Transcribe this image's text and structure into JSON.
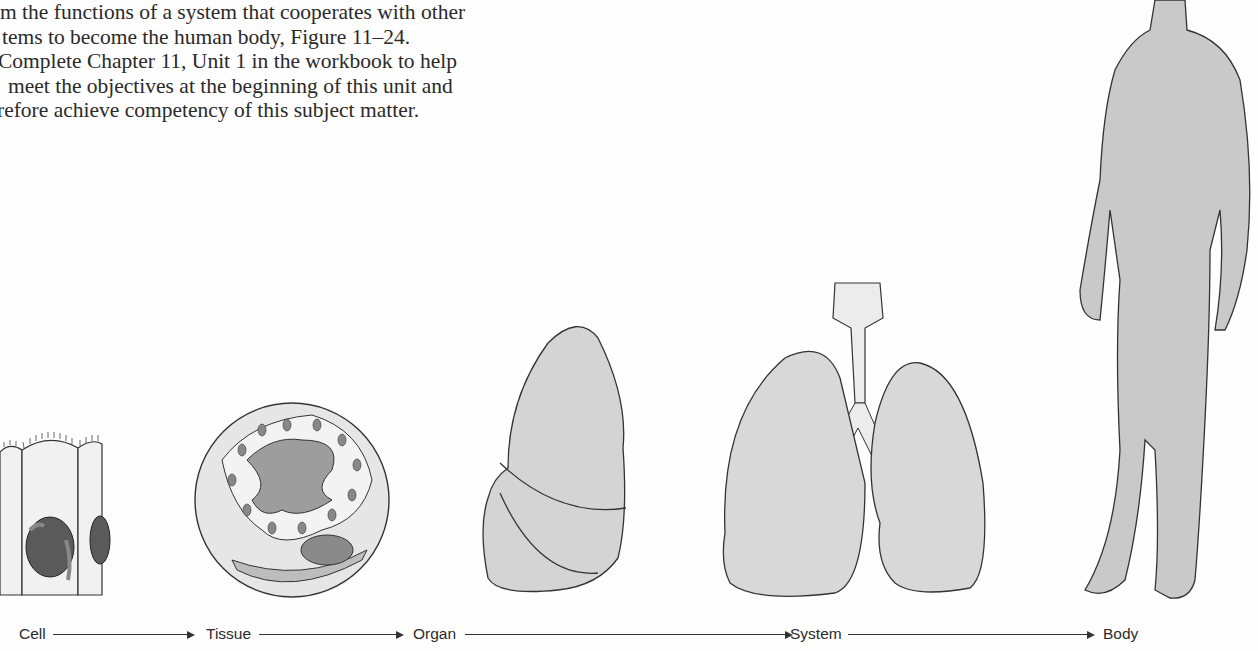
{
  "text": {
    "lines": [
      "m the functions of a system that cooperates with other",
      "tems to become the human body, Figure 11–24.",
      "Complete Chapter 11, Unit 1 in the workbook to help",
      "meet the objectives at the beginning of this unit and",
      "refore achieve competency of this subject matter."
    ]
  },
  "figure": {
    "reference": "Figure 11–24",
    "stages": [
      {
        "label": "Cell",
        "illustration": "cell-illustration"
      },
      {
        "label": "Tissue",
        "illustration": "tissue-illustration"
      },
      {
        "label": "Organ",
        "illustration": "lung-organ-illustration"
      },
      {
        "label": "System",
        "illustration": "respiratory-system-illustration"
      },
      {
        "label": "Body",
        "illustration": "human-body-illustration"
      }
    ]
  }
}
